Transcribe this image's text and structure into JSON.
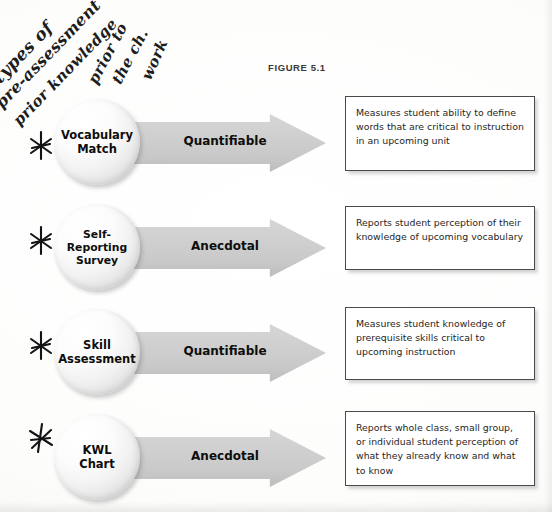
{
  "figure": {
    "label": "FIGURE 5.1"
  },
  "handwriting": {
    "lines": [
      "types of",
      "pre-assessment",
      "prior knowledge",
      "prior to",
      "the ch.",
      "work"
    ]
  },
  "colors": {
    "arrow_fill": "#cfcfcf",
    "bubble_highlight": "#ffffff",
    "bubble_edge": "#b6b6b6",
    "box_border": "#4a4a4a",
    "text": "#0d0d0d",
    "page_background": "#fdfdfc"
  },
  "rows": [
    {
      "marked": true,
      "bubble_label": "Vocabulary\nMatch",
      "arrow_label": "Quantifiable",
      "description": "Measures student ability to define words that are critical to instruction in an upcoming unit"
    },
    {
      "marked": true,
      "bubble_label": "Self-\nReporting\nSurvey",
      "arrow_label": "Anecdotal",
      "description": "Reports student perception of their knowledge of upcoming vocabulary"
    },
    {
      "marked": true,
      "bubble_label": "Skill\nAssessment",
      "arrow_label": "Quantifiable",
      "description": "Measures student knowledge of prerequisite skills critical to upcoming instruction"
    },
    {
      "marked": true,
      "bubble_label": "KWL\nChart",
      "arrow_label": "Anecdotal",
      "description": "Reports whole class, small group, or individual student perception of what they already know and what to know"
    }
  ]
}
